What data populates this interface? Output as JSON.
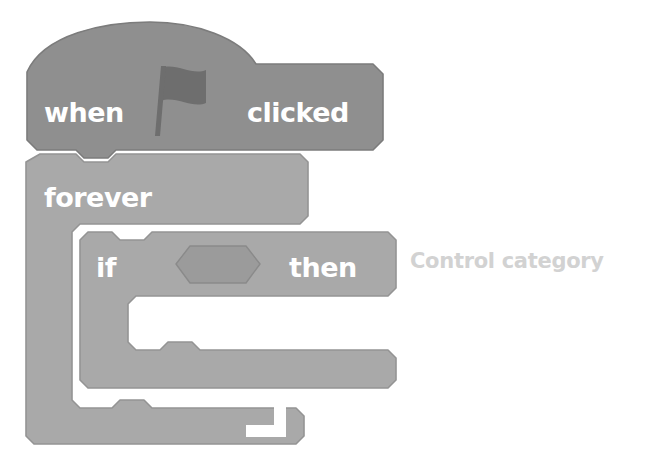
{
  "diagram": {
    "background_color": "#ffffff"
  },
  "annotation": {
    "label": "Control category",
    "color": "#d2d2d2",
    "x": 410,
    "y": 249
  },
  "blocks": [
    {
      "id": "when-flag-clicked",
      "type": "hat",
      "category": "Events",
      "fill_color": "#8f8f8f",
      "stroke_color": "#7c7c7c",
      "label_parts": [
        "when",
        "clicked"
      ],
      "icon": "green-flag-icon",
      "icon_color": "#6e6e6e",
      "text_color": "#ffffff"
    },
    {
      "id": "forever",
      "type": "c-block-loop",
      "category": "Control",
      "fill_color": "#a9a9a9",
      "stroke_color": "#949494",
      "label": "forever",
      "icon": "loop-arrow-icon",
      "icon_color": "#ffffff",
      "text_color": "#ffffff"
    },
    {
      "id": "if-then",
      "type": "c-block-conditional",
      "category": "Control",
      "fill_color": "#a9a9a9",
      "stroke_color": "#949494",
      "label_parts": [
        "if",
        "then"
      ],
      "slot": {
        "id": "boolean-slot",
        "shape": "hexagon",
        "fill_color": "#9b9b9b",
        "stroke_color": "#8a8a8a",
        "value": ""
      },
      "text_color": "#ffffff"
    }
  ],
  "labels": {
    "when": "when",
    "clicked": "clicked",
    "forever": "forever",
    "if": "if",
    "then": "then"
  }
}
